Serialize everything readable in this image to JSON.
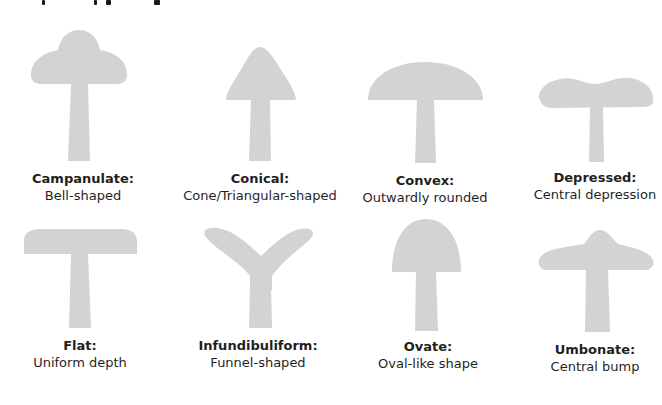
{
  "figure": {
    "shape_color": "#d3d3d3",
    "text_color": "#1f1f1f"
  },
  "cap_shapes": [
    {
      "id": "campanulate",
      "name": "Campanulate:",
      "description": "Bell-shaped"
    },
    {
      "id": "conical",
      "name": "Conical:",
      "description": "Cone/Triangular-shaped"
    },
    {
      "id": "convex",
      "name": "Convex:",
      "description": "Outwardly rounded"
    },
    {
      "id": "depressed",
      "name": "Depressed:",
      "description": "Central depression"
    },
    {
      "id": "flat",
      "name": "Flat:",
      "description": "Uniform depth"
    },
    {
      "id": "infundibuliform",
      "name": "Infundibuliform:",
      "description": "Funnel-shaped"
    },
    {
      "id": "ovate",
      "name": "Ovate:",
      "description": "Oval-like shape"
    },
    {
      "id": "umbonate",
      "name": "Umbonate:",
      "description": "Central bump"
    }
  ]
}
